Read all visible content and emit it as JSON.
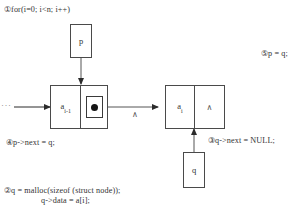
{
  "annotations": {
    "step1": "①for(i=0; i<n; i++)",
    "step2_line1": "②q = malloc(sizeof (struct node));",
    "step2_line2": "q->data = a[i];",
    "step3": "③q->next = NULL;",
    "step4": "④p->next = q;",
    "step5": "⑤p = q;"
  },
  "diagram": {
    "pointer_box_p": "p",
    "pointer_box_q": "q",
    "left_node": {
      "data_label": "a",
      "data_subscript": "i-1",
      "next_field": "pointer-dot"
    },
    "right_node": {
      "data_label": "a",
      "data_subscript": "i",
      "next_field": "∧"
    },
    "mid_null_mark": "∧",
    "list_continuation": "···"
  },
  "colors": {
    "stroke": "#4a4a4a",
    "arrow": "#2b2b2b",
    "text": "#333333",
    "background": "#ffffff",
    "dot": "#141414"
  }
}
